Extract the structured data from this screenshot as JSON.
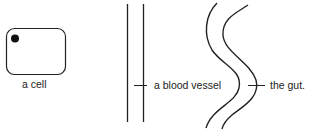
{
  "labels": {
    "cell": "a cell",
    "blood_vessel": "a blood vessel",
    "gut": "the gut."
  },
  "colors": {
    "stroke": "#222222",
    "background": "#ffffff"
  }
}
